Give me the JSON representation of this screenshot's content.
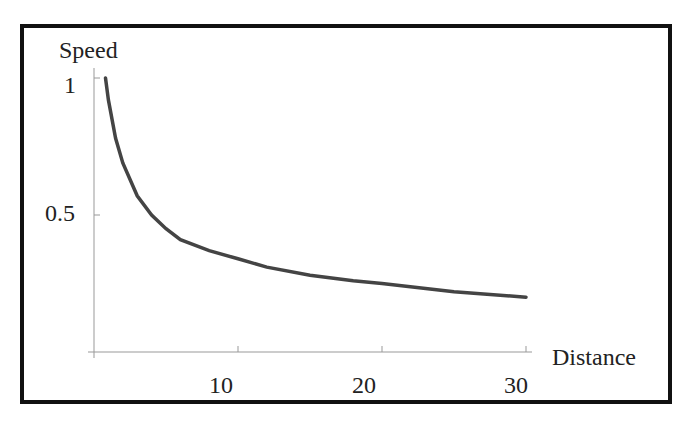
{
  "chart_data": {
    "type": "line",
    "title": "",
    "xlabel": "Distance",
    "ylabel": "Speed",
    "xlim": [
      0,
      30
    ],
    "ylim": [
      0,
      1
    ],
    "xticks": [
      10,
      20,
      30
    ],
    "yticks": [
      0.5,
      1
    ],
    "ytick_labels": [
      "0.5",
      "1"
    ],
    "xtick_labels": [
      "10",
      "20",
      "30"
    ],
    "grid": false,
    "legend": null,
    "series": [
      {
        "name": "Speed vs Distance",
        "x": [
          0.8,
          1,
          1.5,
          2,
          3,
          4,
          5,
          6,
          8,
          10,
          12,
          15,
          18,
          20,
          25,
          30
        ],
        "values": [
          1.0,
          0.92,
          0.78,
          0.69,
          0.57,
          0.5,
          0.45,
          0.41,
          0.37,
          0.34,
          0.31,
          0.28,
          0.26,
          0.25,
          0.22,
          0.2
        ]
      }
    ],
    "colors": {
      "curve": "#444444",
      "axis": "#999999",
      "frame": "#111111"
    }
  }
}
